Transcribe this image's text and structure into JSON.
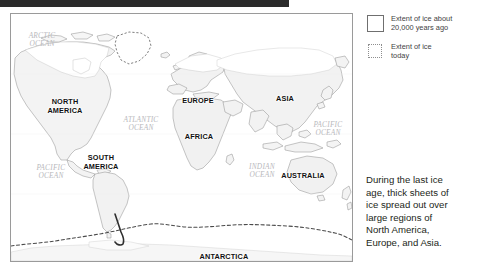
{
  "top_bar": {
    "color": "#2b2b2b"
  },
  "map": {
    "frame_color": "#9a9a9a",
    "land_outline_color": "#8d8d8d",
    "ice_today_color": "#555555",
    "continents": [
      {
        "name": "north-america",
        "label": "NORTH\nAMERICA",
        "x": 54,
        "y": 88
      },
      {
        "name": "south-america",
        "label": "SOUTH\nAMERICA",
        "x": 90,
        "y": 144
      },
      {
        "name": "europe",
        "label": "EUROPE",
        "x": 186,
        "y": 86
      },
      {
        "name": "africa",
        "label": "AFRICA",
        "x": 188,
        "y": 122
      },
      {
        "name": "asia",
        "label": "ASIA",
        "x": 275,
        "y": 84
      },
      {
        "name": "australia",
        "label": "AUSTRALIA",
        "x": 292,
        "y": 161
      },
      {
        "name": "antarctica",
        "label": "ANTARCTICA",
        "x": 213,
        "y": 243
      }
    ],
    "oceans": [
      {
        "name": "arctic-ocean",
        "label": "ARCTIC\nOCEAN",
        "x": 30,
        "y": 23
      },
      {
        "name": "atlantic-ocean",
        "label": "ATLANTIC\nOCEAN",
        "x": 130,
        "y": 108
      },
      {
        "name": "pacific-ocean-west",
        "label": "PACIFIC\nOCEAN",
        "x": 40,
        "y": 155
      },
      {
        "name": "pacific-ocean-east",
        "label": "PACIFIC\nOCEAN",
        "x": 316,
        "y": 113
      },
      {
        "name": "indian-ocean",
        "label": "INDIAN\nOCEAN",
        "x": 250,
        "y": 155
      }
    ]
  },
  "legend": {
    "items": [
      {
        "name": "ice-20000-years-ago",
        "swatch": "solid-box",
        "label": "Extent of ice about\n20,000 years ago"
      },
      {
        "name": "ice-today",
        "swatch": "dotted-box",
        "label": "Extent of ice\ntoday"
      }
    ]
  },
  "caption": {
    "text": "During the last ice\nage, thick sheets of\nice spread out over\nlarge regions of\nNorth America,\nEurope, and Asia."
  }
}
